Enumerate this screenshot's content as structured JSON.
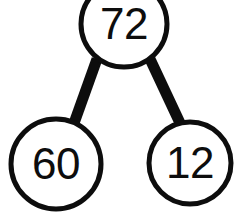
{
  "diagram": {
    "type": "binary-tree",
    "background_color": "#ffffff",
    "stroke_color": "#0d0d0d",
    "node_fill_color": "#ffffff",
    "circle_stroke_width": 5,
    "edge_stroke_width": 11,
    "nodes": [
      {
        "id": "root",
        "label": "72",
        "cx": 124,
        "cy": 24,
        "r": 43,
        "font_size": 44,
        "role": "root"
      },
      {
        "id": "left-child",
        "label": "60",
        "cx": 56,
        "cy": 164,
        "r": 45,
        "font_size": 44,
        "role": "left-child"
      },
      {
        "id": "right-child",
        "label": "12",
        "cx": 190,
        "cy": 163,
        "r": 41,
        "font_size": 44,
        "role": "right-child"
      }
    ],
    "edges": [
      {
        "id": "edge-root-left",
        "from": "root",
        "to": "left-child",
        "x1": 97,
        "y1": 59,
        "x2": 73,
        "y2": 126
      },
      {
        "id": "edge-root-right",
        "from": "root",
        "to": "right-child",
        "x1": 150,
        "y1": 59,
        "x2": 180,
        "y2": 123
      }
    ]
  }
}
